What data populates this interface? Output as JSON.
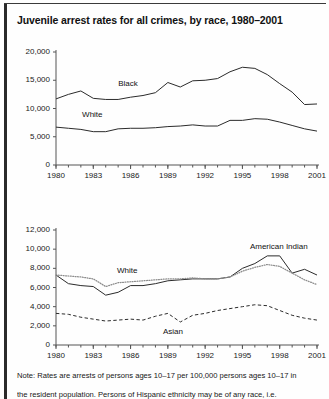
{
  "figure": {
    "title": "Juvenile arrest rates for all crimes, by race, 1980–2001",
    "note_line1": "Note: Rates are arrests of persons ages 10–17 per 100,000 persons ages 10–17 in",
    "note_line2": "the resident population. Persons of Hispanic ethnicity may be of any race, i.e.",
    "colors": {
      "ink": "#1a1a1a",
      "black_series": "#2b2b2b",
      "white_series": "#8c8c8c",
      "american_indian_series": "#2b2b2b",
      "asian_series": "#2b2b2b",
      "axis": "#555555",
      "border": "#2a2a2a"
    }
  },
  "chart_data": [
    {
      "id": "top",
      "type": "line",
      "title": "",
      "xlabel": "",
      "ylabel": "",
      "xlim": [
        1980,
        2001
      ],
      "ylim": [
        0,
        20000
      ],
      "yticks": [
        0,
        5000,
        10000,
        15000,
        20000
      ],
      "ytick_labels": [
        "0",
        "5,000",
        "10,000",
        "15,000",
        "20,000"
      ],
      "xticks": [
        1980,
        1983,
        1986,
        1989,
        1992,
        1995,
        1998,
        2001
      ],
      "xtick_labels": [
        "1980",
        "1983",
        "1986",
        "1989",
        "1992",
        "1995",
        "1998",
        "2001"
      ],
      "minor_xticks": true,
      "grid": false,
      "legend": "inline-labels",
      "x": [
        1980,
        1981,
        1982,
        1983,
        1984,
        1985,
        1986,
        1987,
        1988,
        1989,
        1990,
        1991,
        1992,
        1993,
        1994,
        1995,
        1996,
        1997,
        1998,
        1999,
        2000,
        2001
      ],
      "series": [
        {
          "name": "Black",
          "style": "solid",
          "label_x": 1985.0,
          "label_y": 14300,
          "values": [
            11700,
            12500,
            13100,
            11800,
            11600,
            11600,
            12000,
            12300,
            12800,
            14600,
            13800,
            14900,
            15000,
            15300,
            16500,
            17300,
            17100,
            16000,
            14400,
            12900,
            10700,
            10800
          ]
        },
        {
          "name": "White",
          "style": "solid",
          "label_x": 1982.1,
          "label_y": 8900,
          "values": [
            6700,
            6500,
            6300,
            5900,
            5900,
            6400,
            6500,
            6500,
            6600,
            6800,
            6900,
            7100,
            6900,
            6900,
            7900,
            7900,
            8200,
            8100,
            7600,
            7000,
            6400,
            6000
          ]
        }
      ]
    },
    {
      "id": "bottom",
      "type": "line",
      "title": "",
      "xlabel": "",
      "ylabel": "",
      "xlim": [
        1980,
        2001
      ],
      "ylim": [
        0,
        12000
      ],
      "yticks": [
        0,
        2000,
        4000,
        6000,
        8000,
        10000,
        12000
      ],
      "ytick_labels": [
        "0",
        "2,000",
        "4,000",
        "6,000",
        "8,000",
        "10,000",
        "12,000"
      ],
      "xticks": [
        1980,
        1983,
        1986,
        1989,
        1992,
        1995,
        1998,
        2001
      ],
      "xtick_labels": [
        "1980",
        "1983",
        "1986",
        "1989",
        "1992",
        "1995",
        "1998",
        "2001"
      ],
      "minor_xticks": true,
      "grid": false,
      "legend": "inline-labels",
      "x": [
        1980,
        1981,
        1982,
        1983,
        1984,
        1985,
        1986,
        1987,
        1988,
        1989,
        1990,
        1991,
        1992,
        1993,
        1994,
        1995,
        1996,
        1997,
        1998,
        1999,
        2000,
        2001
      ],
      "series": [
        {
          "name": "American Indian",
          "style": "solid",
          "label_x": 1995.6,
          "label_y": 10200,
          "values": [
            7300,
            6400,
            6200,
            6100,
            5200,
            5500,
            6200,
            6200,
            6400,
            6700,
            6800,
            6900,
            6900,
            6900,
            7100,
            8000,
            8500,
            9300,
            9300,
            7500,
            7900,
            7300
          ]
        },
        {
          "name": "White",
          "style": "dotted",
          "label_x": 1984.9,
          "label_y": 7700,
          "values": [
            7300,
            7200,
            7100,
            6900,
            6100,
            6500,
            6600,
            6700,
            6800,
            6900,
            6900,
            7000,
            6900,
            6900,
            7100,
            7700,
            8100,
            8400,
            8200,
            7500,
            6800,
            6300
          ]
        },
        {
          "name": "Asian",
          "style": "dashed",
          "label_x": 1988.6,
          "label_y": 1350,
          "values": [
            3300,
            3200,
            2900,
            2700,
            2500,
            2600,
            2700,
            2600,
            3000,
            3300,
            2400,
            3100,
            3300,
            3600,
            3800,
            4000,
            4200,
            4100,
            3600,
            3100,
            2800,
            2600
          ]
        }
      ]
    }
  ]
}
